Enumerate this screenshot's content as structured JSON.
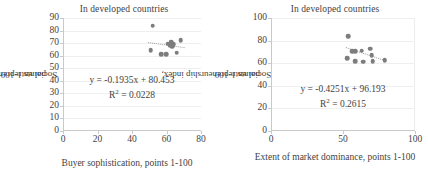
{
  "chart_data": [
    {
      "type": "scatter",
      "title": "In developed countries",
      "xlabel": "Buyer sophistication, points 1-100",
      "ylabel_line1": "Social entrepreneurship index,",
      "ylabel_line2": "points 1-100",
      "xlim": [
        0,
        80
      ],
      "ylim": [
        0,
        90
      ],
      "xticks": [
        0,
        20,
        40,
        60,
        80
      ],
      "yticks": [
        0,
        10,
        20,
        30,
        40,
        50,
        60,
        70,
        80,
        90
      ],
      "grid": true,
      "marker_color": "#7d7d7d",
      "trendline_color": "#9a9a9a",
      "equation": "y = -0.1935x + 80.453",
      "r_squared_label": "R",
      "r_squared_exp": "2",
      "r_squared_value": " = 0.0228",
      "slope": -0.1935,
      "intercept": 80.453,
      "r2": 0.0228,
      "trendline_x": [
        49,
        70
      ],
      "points": [
        {
          "x": 52.0,
          "y": 84.0
        },
        {
          "x": 50.8,
          "y": 64.5
        },
        {
          "x": 57.0,
          "y": 61.0
        },
        {
          "x": 59.8,
          "y": 61.0
        },
        {
          "x": 60.8,
          "y": 69.5
        },
        {
          "x": 62.0,
          "y": 68.5
        },
        {
          "x": 62.6,
          "y": 70.5
        },
        {
          "x": 63.2,
          "y": 67.5
        },
        {
          "x": 63.8,
          "y": 69.0
        },
        {
          "x": 65.8,
          "y": 62.5
        },
        {
          "x": 68.2,
          "y": 72.5
        }
      ]
    },
    {
      "type": "scatter",
      "title": "In developed countries",
      "xlabel": "Extent of market dominance, points 1-100",
      "ylabel_line1": "Social entrepreneurship index,",
      "ylabel_line2": "points 1-100",
      "xlim": [
        0,
        100
      ],
      "ylim": [
        0,
        100
      ],
      "xticks": [
        0,
        50,
        100
      ],
      "yticks": [
        0,
        20,
        40,
        60,
        80,
        100
      ],
      "grid": true,
      "marker_color": "#7d7d7d",
      "trendline_color": "#9a9a9a",
      "equation": "y = -0.4251x + 96.193",
      "r_squared_label": "R",
      "r_squared_exp": "2",
      "r_squared_value": " = 0.2615",
      "slope": -0.4251,
      "intercept": 96.193,
      "r2": 0.2615,
      "trendline_x": [
        52,
        80
      ],
      "points": [
        {
          "x": 53.5,
          "y": 84.0
        },
        {
          "x": 53.0,
          "y": 64.5
        },
        {
          "x": 56.5,
          "y": 70.5
        },
        {
          "x": 58.5,
          "y": 70.5
        },
        {
          "x": 58.5,
          "y": 62.0
        },
        {
          "x": 63.0,
          "y": 71.0
        },
        {
          "x": 64.0,
          "y": 61.5
        },
        {
          "x": 69.0,
          "y": 73.0
        },
        {
          "x": 70.0,
          "y": 67.0
        },
        {
          "x": 70.5,
          "y": 62.0
        },
        {
          "x": 79.0,
          "y": 62.5
        }
      ]
    }
  ]
}
